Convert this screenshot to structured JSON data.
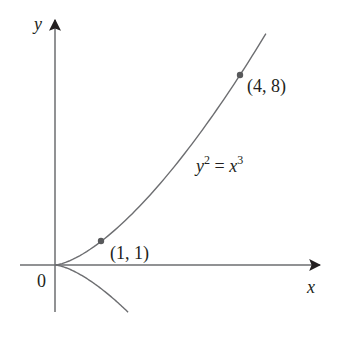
{
  "chart_data": {
    "type": "line",
    "title": "",
    "equation_label": {
      "lhs": "y",
      "lhs_exp": "2",
      "eq": " = ",
      "rhs": "x",
      "rhs_exp": "3"
    },
    "xlabel": "x",
    "ylabel": "y",
    "origin_label": "0",
    "series": [
      {
        "name": "upper branch y = x^(3/2)",
        "x": [
          0,
          0.5,
          1,
          1.5,
          2,
          2.5,
          3,
          3.5,
          4,
          4.56
        ],
        "y": [
          0,
          0.354,
          1,
          1.837,
          2.828,
          3.953,
          5.196,
          6.548,
          8,
          9.74
        ]
      },
      {
        "name": "lower branch y = -x^(3/2)",
        "x": [
          0,
          0.5,
          1,
          1.3,
          1.58
        ],
        "y": [
          0,
          -0.354,
          -1,
          -1.482,
          -1.99
        ]
      }
    ],
    "points": [
      {
        "label": "(1, 1)",
        "x": 1,
        "y": 1
      },
      {
        "label": "(4, 8)",
        "x": 4,
        "y": 8
      }
    ],
    "xlim": [
      -0.75,
      6.2
    ],
    "ylim": [
      -3,
      11
    ],
    "grid": false,
    "colors": {
      "curve": "#6d6e71",
      "axis": "#231f20",
      "point": "#58595b"
    }
  }
}
